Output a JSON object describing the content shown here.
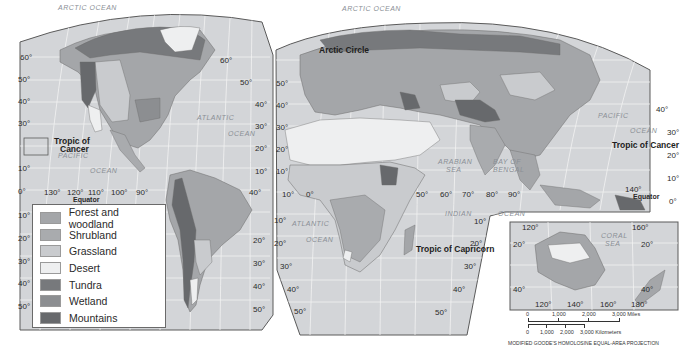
{
  "map": {
    "title": "World Biomes",
    "projection_note": "MODIFIED GOODE'S HOMOLOSINE EQUAL-AREA PROJECTION",
    "colors": {
      "water": "#d3d5d8",
      "gridline": "#f2f2f2",
      "forest": "#a4a6a9",
      "shrubland": "#a9abae",
      "grassland": "#c9cbce",
      "desert": "#eeeff0",
      "tundra": "#77797c",
      "wetland": "#8c8e91",
      "mountains": "#67696c",
      "outline": "#5a5a5a"
    }
  },
  "legend": {
    "items": [
      {
        "label": "Forest and woodland",
        "color": "#a4a6a9"
      },
      {
        "label": "Shrubland",
        "color": "#a9abae"
      },
      {
        "label": "Grassland",
        "color": "#c9cbce"
      },
      {
        "label": "Desert",
        "color": "#eeeff0"
      },
      {
        "label": "Tundra",
        "color": "#77797c"
      },
      {
        "label": "Wetland",
        "color": "#8c8e91"
      },
      {
        "label": "Mountains",
        "color": "#67696c"
      }
    ]
  },
  "labels": {
    "special": {
      "arctic_circle": "Arctic Circle",
      "tropic_cancer_west": "Tropic of\nCancer",
      "tropic_cancer_west_l1": "Tropic of",
      "tropic_cancer_west_l2": "Cancer",
      "tropic_cancer_east": "Tropic of Cancer",
      "tropic_capricorn": "Tropic of Capricorn",
      "equator_west": "Equator",
      "equator_east": "Equator"
    },
    "oceans": {
      "arctic_west": "ARCTIC OCEAN",
      "arctic_east": "ARCTIC OCEAN",
      "atlantic_n1": "ATLANTIC",
      "atlantic_n2": "OCEAN",
      "pacific_w1": "PACIFIC",
      "pacific_w2": "OCEAN",
      "atlantic_s1": "ATLANTIC",
      "atlantic_s2": "OCEAN",
      "indian1": "INDIAN",
      "indian2": "OCEAN",
      "arabian1": "ARABIAN",
      "arabian2": "SEA",
      "bengal1": "BAY OF",
      "bengal2": "BENGAL",
      "pacific_e1": "PACIFIC",
      "pacific_e2": "OCEAN",
      "coral1": "CORAL",
      "coral2": "SEA"
    },
    "west_lat_left": [
      "60°",
      "50°",
      "40°",
      "30°",
      "10°",
      "0°",
      "10°",
      "20°",
      "30°",
      "40°",
      "50°"
    ],
    "west_lat_right": [
      "60°",
      "50°",
      "40°",
      "30°",
      "20°",
      "10°",
      "40°",
      "20°",
      "30°",
      "40°",
      "50°"
    ],
    "west_lon": [
      "130°",
      "120°",
      "110°",
      "100°",
      "90°"
    ],
    "euro_lat_left": [
      "50°",
      "40°",
      "30°",
      "20°",
      "10°",
      "10°",
      "20°",
      "30°",
      "40°",
      "50°"
    ],
    "africa_lon": [
      "10°",
      "0°",
      "50°",
      "60°",
      "70°",
      "80°",
      "90°"
    ],
    "africa_lat_right": [
      "10°",
      "20°",
      "30°",
      "40°",
      "50°"
    ],
    "east_lat_right": [
      "40°",
      "30°",
      "20°",
      "10°",
      "0°"
    ],
    "east_lon": [
      "140°"
    ],
    "aus_top_lon": [
      "120°",
      "160°"
    ],
    "aus_lat_left": [
      "20°",
      "40°"
    ],
    "aus_lat_right": [
      "20°",
      "40°"
    ],
    "aus_bottom_lon": [
      "120°",
      "140°",
      "160°",
      "180°"
    ]
  },
  "scale": {
    "miles_ticks": [
      "0",
      "1,000",
      "2,000",
      "3,000 Miles"
    ],
    "km_ticks": [
      "0",
      "1,000",
      "2,000",
      "3,000 Kilometers"
    ]
  }
}
